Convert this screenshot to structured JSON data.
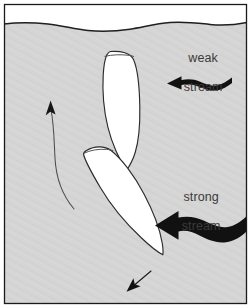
{
  "figure": {
    "kind": "diagram",
    "frame": {
      "border_color": "#1a1a1a",
      "border_width_px": 1,
      "outer_background": "#ffffff"
    },
    "water": {
      "fill_color": "#d4d4d4",
      "surface_line_color": "#1a1a1a",
      "sky_color": "#ffffff",
      "surface_label": "water surface"
    },
    "boats": [
      {
        "id": "boat-upper",
        "position_label": "upper boat",
        "orientation": "vertical, bow down",
        "fill_color": "#ffffff",
        "outline_color": "#2b2b2b"
      },
      {
        "id": "boat-lower",
        "position_label": "lower boat",
        "orientation": "tilted, bow down-right",
        "fill_color": "#ffffff",
        "outline_color": "#2b2b2b"
      }
    ],
    "streams": [
      {
        "id": "weak-stream",
        "label_line_1": "weak",
        "label_line_2": "stream",
        "direction": "leftward",
        "arrow_color": "#111111",
        "arrow_weight": "thin"
      },
      {
        "id": "strong-stream",
        "label_line_1": "strong",
        "label_line_2": "stream",
        "direction": "leftward",
        "arrow_color": "#111111",
        "arrow_weight": "thick"
      }
    ],
    "motion_arrows": [
      {
        "id": "drift-arrow",
        "label": "curved upward drift arrow",
        "direction": "upward, curving left",
        "color": "#4a4a4a",
        "weight": "hairline"
      },
      {
        "id": "heading-arrow",
        "label": "small heading arrow",
        "direction": "down-left",
        "color": "#111111",
        "weight": "hairline"
      }
    ]
  }
}
